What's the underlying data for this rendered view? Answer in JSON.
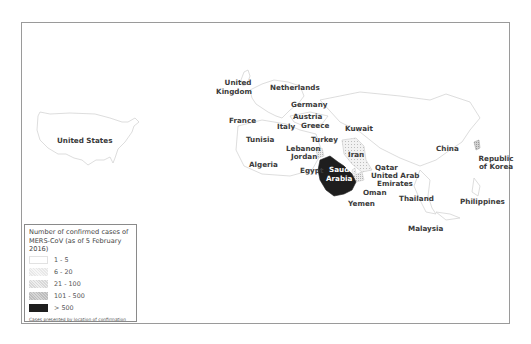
{
  "map": {
    "title": "MERS-CoV confirmed cases by country",
    "colors": {
      "border": "#9a9a9a",
      "outline": "#c8c8c8",
      "band_1_5": "#ffffff",
      "band_6_20": "#e6e6e6",
      "band_21_100": "#dedede",
      "band_101_500": "#c9c9c9",
      "band_over_500": "#1e1e1e"
    },
    "countries": [
      {
        "name": "United States",
        "band": "1 - 5"
      },
      {
        "name": "United Kingdom",
        "band": "1 - 5"
      },
      {
        "name": "Netherlands",
        "band": "1 - 5"
      },
      {
        "name": "Germany",
        "band": "1 - 5"
      },
      {
        "name": "France",
        "band": "1 - 5"
      },
      {
        "name": "Austria",
        "band": "1 - 5"
      },
      {
        "name": "Italy",
        "band": "1 - 5"
      },
      {
        "name": "Greece",
        "band": "1 - 5"
      },
      {
        "name": "Tunisia",
        "band": "1 - 5"
      },
      {
        "name": "Turkey",
        "band": "1 - 5"
      },
      {
        "name": "Lebanon",
        "band": "1 - 5"
      },
      {
        "name": "Jordan",
        "band": "21 - 100"
      },
      {
        "name": "Algeria",
        "band": "1 - 5"
      },
      {
        "name": "Egypt",
        "band": "1 - 5"
      },
      {
        "name": "Saudi Arabia",
        "band": "> 500"
      },
      {
        "name": "Kuwait",
        "band": "1 - 5"
      },
      {
        "name": "Iran",
        "band": "6 - 20"
      },
      {
        "name": "Qatar",
        "band": "6 - 20"
      },
      {
        "name": "United Arab Emirates",
        "band": "21 - 100"
      },
      {
        "name": "Oman",
        "band": "1 - 5"
      },
      {
        "name": "Yemen",
        "band": "1 - 5"
      },
      {
        "name": "China",
        "band": "1 - 5"
      },
      {
        "name": "Republic of Korea",
        "band": "101 - 500"
      },
      {
        "name": "Thailand",
        "band": "1 - 5"
      },
      {
        "name": "Philippines",
        "band": "1 - 5"
      },
      {
        "name": "Malaysia",
        "band": "1 - 5"
      }
    ],
    "labels": {
      "us": "United States",
      "uk_1": "United",
      "uk_2": "Kingdom",
      "netherlands": "Netherlands",
      "germany": "Germany",
      "france": "France",
      "austria": "Austria",
      "italy": "Italy",
      "greece": "Greece",
      "tunisia": "Tunisia",
      "turkey": "Turkey",
      "lebanon": "Lebanon",
      "jordan": "Jordan",
      "algeria": "Algeria",
      "egypt": "Egypt",
      "saudi_1": "Saudi",
      "saudi_2": "Arabia",
      "kuwait": "Kuwait",
      "iran": "Iran",
      "qatar": "Qatar",
      "uae_1": "United Arab",
      "uae_2": "Emirates",
      "oman": "Oman",
      "yemen": "Yemen",
      "china": "China",
      "korea_1": "Republic",
      "korea_2": "of Korea",
      "thailand": "Thailand",
      "philippines": "Philippines",
      "malaysia": "Malaysia"
    }
  },
  "legend": {
    "title_line1": "Number of confirmed cases of",
    "title_line2": "MERS-CoV (as of 5 February 2016)",
    "items": [
      {
        "label": "1 - 5"
      },
      {
        "label": "6 - 20"
      },
      {
        "label": "21 - 100"
      },
      {
        "label": "101 - 500"
      },
      {
        "label": "> 500"
      }
    ],
    "note": "Cases presented by location of confirmation"
  }
}
